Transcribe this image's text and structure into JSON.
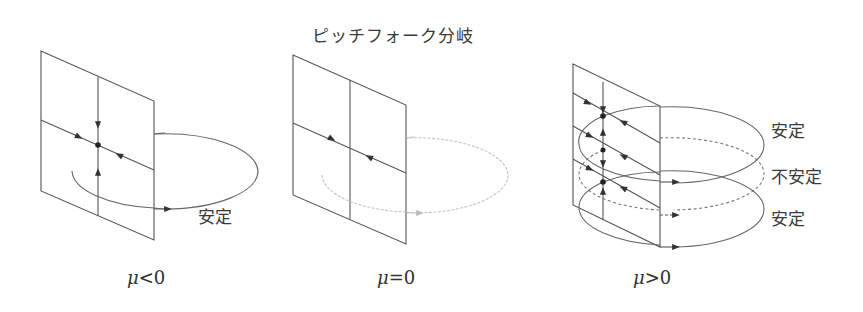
{
  "title": "ピッチフォーク分岐",
  "panels": [
    {
      "id": "mu-negative",
      "condition_symbol": "μ",
      "condition_rest": "<0",
      "cycles": [
        {
          "label": "安定",
          "stability": "stable",
          "style": "solid"
        }
      ]
    },
    {
      "id": "mu-zero",
      "condition_symbol": "μ",
      "condition_rest": "=0",
      "cycles": [
        {
          "label": "",
          "stability": "neutral",
          "style": "faint-dotted"
        }
      ]
    },
    {
      "id": "mu-positive",
      "condition_symbol": "μ",
      "condition_rest": ">0",
      "cycles": [
        {
          "label": "安定",
          "stability": "stable",
          "style": "solid"
        },
        {
          "label": "不安定",
          "stability": "unstable",
          "style": "dashed"
        },
        {
          "label": "安定",
          "stability": "stable",
          "style": "solid"
        }
      ]
    }
  ],
  "colors": {
    "line": "#555555",
    "faint": "#bdbdbd",
    "text": "#3a3a3a"
  }
}
